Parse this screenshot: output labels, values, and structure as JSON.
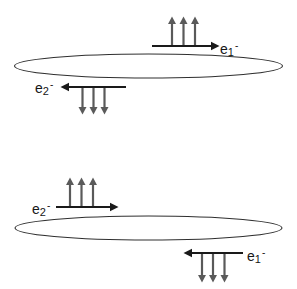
{
  "colors": {
    "background": "#ffffff",
    "loop_outline": "#2f2f2f",
    "current_arrow": "#1a1a1a",
    "field_arrow": "#5a5a5a",
    "label_text": "#161616"
  },
  "upper_diagram": {
    "loop": "ellipse",
    "e1": {
      "base": "e",
      "sub": "1",
      "sup": "-",
      "position": "above-loop-right",
      "current_direction": "right",
      "field_direction": "up",
      "field_arrow_count": 3
    },
    "e2": {
      "base": "e",
      "sub": "2",
      "sup": "-",
      "position": "below-loop-left",
      "current_direction": "left",
      "field_direction": "down",
      "field_arrow_count": 3
    }
  },
  "lower_diagram": {
    "loop": "ellipse",
    "e2": {
      "base": "e",
      "sub": "2",
      "sup": "-",
      "position": "above-loop-left",
      "current_direction": "right",
      "field_direction": "up",
      "field_arrow_count": 3
    },
    "e1": {
      "base": "e",
      "sub": "1",
      "sup": "-",
      "position": "below-loop-right",
      "current_direction": "left",
      "field_direction": "down",
      "field_arrow_count": 3
    }
  }
}
